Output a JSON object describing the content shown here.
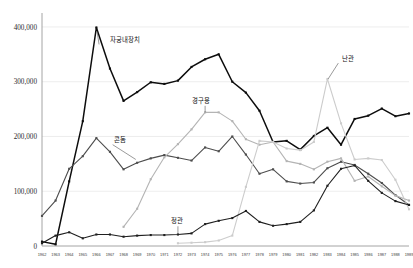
{
  "chart_data": {
    "type": "line",
    "title": "",
    "subtitle": "",
    "xlabel": "",
    "ylabel": "",
    "grid": true,
    "legend_position": "inline-annotations",
    "ylim": [
      0,
      420000
    ],
    "yticks": [
      0,
      100000,
      200000,
      300000,
      400000
    ],
    "ytick_labels": [
      "0",
      "100,000",
      "200,000",
      "300,000",
      "400,000"
    ],
    "x": [
      1962,
      1963,
      1964,
      1965,
      1966,
      1967,
      1968,
      1969,
      1970,
      1971,
      1972,
      1973,
      1974,
      1975,
      1976,
      1977,
      1978,
      1979,
      1980,
      1981,
      1982,
      1983,
      1984,
      1985,
      1986,
      1987,
      1988,
      1989
    ],
    "xtick_labels": [
      "1962",
      "1963",
      "1964",
      "1965",
      "1966",
      "1967",
      "1968",
      "1969",
      "1970",
      "1971",
      "1972",
      "1973",
      "1974",
      "1975",
      "1976",
      "1977",
      "1978",
      "1979",
      "1980",
      "1981",
      "1982",
      "1983",
      "1984",
      "1985",
      "1986",
      "1987",
      "1988",
      "1989"
    ],
    "series": [
      {
        "name": "자궁내장치",
        "label": "자궁내장치",
        "color": "#0d0d0d",
        "width": 1.5,
        "marker": "square",
        "label_x": 1967.0,
        "label_y": 372000,
        "leader_from_x": 1966.2,
        "leader_from_y": 368000,
        "leader_to_x": 1966.05,
        "leader_to_y": 392000,
        "values": [
          8000,
          3000,
          118000,
          228000,
          399000,
          324000,
          265000,
          281000,
          299000,
          296000,
          302000,
          327000,
          341000,
          350000,
          300000,
          280000,
          247000,
          190000,
          192000,
          176000,
          201000,
          216000,
          185000,
          232000,
          238000,
          251000,
          237000,
          242000
        ]
      },
      {
        "name": "콘돔",
        "label": "콘돔",
        "color": "#4d4d4d",
        "width": 1.1,
        "marker": "square",
        "label_x": 1967.3,
        "label_y": 190000,
        "leader_from_x": 1967.2,
        "leader_from_y": 185000,
        "leader_to_x": 1968.9,
        "leader_to_y": 158000,
        "values": [
          55000,
          83000,
          141000,
          164000,
          197000,
          172000,
          140000,
          152000,
          160000,
          166000,
          161000,
          156000,
          180000,
          173000,
          200000,
          167000,
          132000,
          140000,
          118000,
          114000,
          116000,
          142000,
          154000,
          148000,
          132000,
          115000,
          93000,
          75000
        ]
      },
      {
        "name": "경구용",
        "label": "경구용",
        "color": "#b4b4b4",
        "width": 1.1,
        "marker": "square",
        "label_x": 1973.0,
        "label_y": 262000,
        "leader_from_x": 1974.0,
        "leader_from_y": 256000,
        "leader_to_x": 1974.0,
        "leader_to_y": 244000,
        "values": [
          null,
          null,
          null,
          null,
          null,
          null,
          35000,
          68000,
          122000,
          162000,
          186000,
          213000,
          244000,
          244000,
          228000,
          195000,
          185000,
          190000,
          155000,
          150000,
          140000,
          154000,
          160000,
          119000,
          127000,
          109000,
          92000,
          83000
        ]
      },
      {
        "name": "난관",
        "label": "난관",
        "color": "#cccccc",
        "width": 1.1,
        "marker": "square",
        "label_x": 1984.1,
        "label_y": 338000,
        "leader_from_x": 1983.8,
        "leader_from_y": 334000,
        "leader_to_x": 1983.05,
        "leader_to_y": 305000,
        "values": [
          null,
          null,
          null,
          null,
          null,
          null,
          null,
          null,
          null,
          null,
          5000,
          6000,
          7000,
          10000,
          19000,
          108000,
          192000,
          190000,
          178000,
          175000,
          190000,
          305000,
          224000,
          158000,
          160000,
          157000,
          121000,
          67000
        ]
      },
      {
        "name": "정관",
        "label": "정관",
        "color": "#1f1f1f",
        "width": 1.1,
        "marker": "square",
        "label_x": 1971.5,
        "label_y": 42000,
        "leader_from_x": 1972.0,
        "leader_from_y": 36000,
        "leader_to_x": 1972.0,
        "leader_to_y": 21000,
        "values": [
          5000,
          19000,
          25000,
          14000,
          21000,
          21000,
          17000,
          19000,
          20000,
          20000,
          21000,
          23000,
          40000,
          46000,
          51000,
          64000,
          44000,
          37000,
          40000,
          44000,
          65000,
          110000,
          141000,
          147000,
          119000,
          97000,
          82000,
          75000
        ]
      }
    ]
  }
}
